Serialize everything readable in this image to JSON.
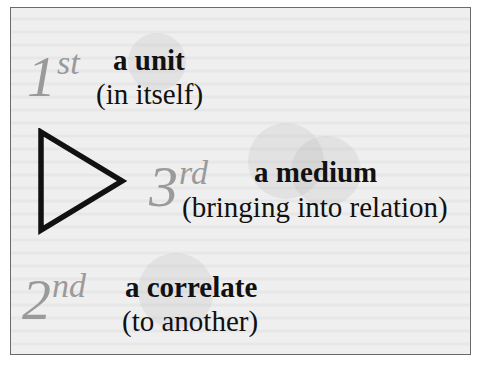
{
  "diagram": {
    "type": "triadic-sign-diagram",
    "colors": {
      "ordinal": "#9a9a9a",
      "text": "#111111",
      "frame_border": "#6a6a6a",
      "frame_background": "#efefef",
      "triangle_stroke": "#111111"
    },
    "icon": "triangle-right-icon",
    "items": [
      {
        "number": "1",
        "suffix": "st",
        "term": "a unit",
        "gloss": "(in itself)"
      },
      {
        "number": "3",
        "suffix": "rd",
        "term": "a medium",
        "gloss": "(bringing into relation)"
      },
      {
        "number": "2",
        "suffix": "nd",
        "term": "a correlate",
        "gloss": "(to another)"
      }
    ]
  }
}
